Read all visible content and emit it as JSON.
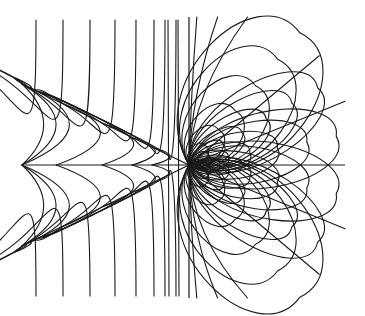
{
  "figure": {
    "type": "field-line-diagram",
    "background": "#ffffff",
    "stroke_color": "#1a1a1a",
    "singular_point": {
      "x": 189,
      "y": 165
    },
    "vertical_axis": {
      "x": 189,
      "y1": 17,
      "y2": 298
    },
    "horizontal_axis": {
      "y": 165,
      "x1": 25,
      "x2": 345
    },
    "left_rays": [
      {
        "x1": 22,
        "y1": 84,
        "x2": 189,
        "y2": 165
      },
      {
        "x1": 22,
        "y1": 246,
        "x2": 189,
        "y2": 165
      }
    ],
    "left_outer_curves": {
      "description": "corner-turning curves: vertical at top/bottom edge, bending into diagonal ray",
      "top_x_positions": [
        36,
        63,
        90,
        115,
        136,
        154,
        165,
        176
      ],
      "edge_y_top": 20,
      "edge_y_bottom": 296
    },
    "left_inner_curves": {
      "description": "nested parabola-like arcs opening left between the diagonal rays",
      "vertex_x": [
        48,
        75,
        104,
        132,
        155,
        170,
        180
      ]
    },
    "right_petals": {
      "description": "loops tangent to singular point, tips joining along rays",
      "ray_angles_deg": [
        0,
        22,
        40,
        -22,
        -40
      ],
      "sizes": [
        22,
        40,
        62,
        90,
        120,
        150
      ]
    },
    "right_near_vertical": {
      "top_offsets": [
        6,
        22,
        45
      ],
      "description": "curves emerging from singular point nearly vertical"
    }
  }
}
